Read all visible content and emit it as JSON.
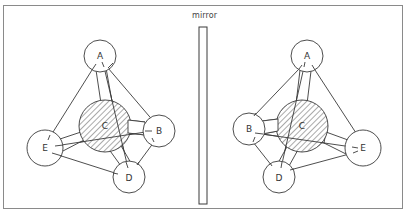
{
  "diagram": {
    "mirror_label": "mirror",
    "colors": {
      "line": "#3a3a3a",
      "frame": "#8a8a8a",
      "background": "#ffffff",
      "hatch": "#555555"
    },
    "left_molecule": {
      "central_atom": {
        "label": "C",
        "x": 105,
        "y": 126,
        "r": 26,
        "hatched": true
      },
      "atoms": [
        {
          "label": "A",
          "x": 100,
          "y": 56,
          "r": 16
        },
        {
          "label": "B",
          "x": 159,
          "y": 131,
          "r": 16
        },
        {
          "label": "D",
          "x": 129,
          "y": 177,
          "r": 16
        },
        {
          "label": "E",
          "x": 45,
          "y": 148,
          "r": 18
        }
      ]
    },
    "right_molecule": {
      "central_atom": {
        "label": "C",
        "x": 302,
        "y": 126,
        "r": 26,
        "hatched": true
      },
      "atoms": [
        {
          "label": "A",
          "x": 307,
          "y": 56,
          "r": 16
        },
        {
          "label": "B",
          "x": 249,
          "y": 129,
          "r": 16
        },
        {
          "label": "D",
          "x": 279,
          "y": 177,
          "r": 16
        },
        {
          "label": "E",
          "x": 363,
          "y": 148,
          "r": 18
        }
      ]
    }
  }
}
